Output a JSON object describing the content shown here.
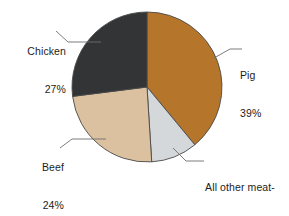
{
  "chart_data": {
    "type": "pie",
    "title": "",
    "categories": [
      "Pig",
      "All other meat-producing species",
      "Beef",
      "Chicken"
    ],
    "values": [
      39,
      10,
      24,
      27
    ],
    "value_unit": "%",
    "legend_position": "none",
    "labels_style": "external-with-leader-lines",
    "start_angle_deg": 0,
    "direction": "clockwise",
    "slices": [
      {
        "name": "Pig",
        "value": 39,
        "value_text": "39%",
        "color": "#b5762b",
        "start_deg": 0,
        "end_deg": 140.4
      },
      {
        "name": "All other meat-producing species",
        "value": 10,
        "value_text": "10%",
        "color": "#d5d8da",
        "start_deg": 140.4,
        "end_deg": 176.4
      },
      {
        "name": "Beef",
        "value": 24,
        "value_text": "24%",
        "color": "#dcc1a0",
        "start_deg": 176.4,
        "end_deg": 262.8
      },
      {
        "name": "Chicken",
        "value": 27,
        "value_text": "27%",
        "color": "#333436",
        "start_deg": 262.8,
        "end_deg": 360
      }
    ]
  },
  "colors": {
    "background": "#ffffff",
    "pig": "#b5762b",
    "other": "#d5d8da",
    "beef": "#dcc1a0",
    "chicken": "#333436",
    "outline": "#4a4a4a",
    "leader_line": "#6e6e6e",
    "text": "#1c1c1c"
  },
  "labels": {
    "chicken": {
      "name": "Chicken",
      "value_text": "27%"
    },
    "pig": {
      "name": "Pig",
      "value_text": "39%"
    },
    "beef": {
      "name": "Beef",
      "value_text": "24%"
    },
    "other": {
      "line1": "All other meat-",
      "line2": "producing",
      "line3": "species",
      "value_text": "10%"
    }
  }
}
